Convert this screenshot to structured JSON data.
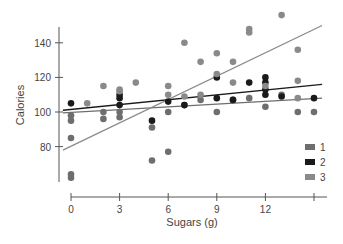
{
  "chart_data": {
    "type": "scatter",
    "title": "",
    "xlabel": "Sugars (g)",
    "ylabel": "Calories",
    "xlim": [
      0,
      15
    ],
    "ylim": [
      60,
      155
    ],
    "x_ticks": [
      0,
      3,
      6,
      9,
      12,
      15
    ],
    "x_tick_labels": [
      "0",
      "3",
      "6",
      "9",
      "12",
      ""
    ],
    "y_ticks": [
      80,
      100,
      120,
      140
    ],
    "y_tick_labels": [
      "80",
      "100",
      "120",
      "140"
    ],
    "grid": false,
    "legend_position": "lower-right",
    "legend": [
      {
        "label": "1",
        "color": "#6e6e6e"
      },
      {
        "label": "2",
        "color": "#1a1a1a"
      },
      {
        "label": "3",
        "color": "#8a8a8a"
      }
    ],
    "series": [
      {
        "name": "1",
        "color": "#6e6e6e",
        "points": [
          [
            0,
            62
          ],
          [
            0,
            64
          ],
          [
            0,
            85
          ],
          [
            0,
            95
          ],
          [
            0,
            98
          ],
          [
            2,
            100
          ],
          [
            2,
            96
          ],
          [
            3,
            97
          ],
          [
            3,
            100
          ],
          [
            5,
            91
          ],
          [
            5,
            72
          ],
          [
            6,
            77
          ],
          [
            6,
            100
          ],
          [
            7,
            104
          ],
          [
            8,
            107
          ],
          [
            9,
            100
          ],
          [
            10,
            107
          ],
          [
            11,
            108
          ],
          [
            12,
            103
          ],
          [
            13,
            110
          ],
          [
            14,
            100
          ],
          [
            15,
            100
          ]
        ],
        "fit": {
          "x0": -0.5,
          "y0": 99.5,
          "x1": 15.5,
          "y1": 108
        }
      },
      {
        "name": "2",
        "color": "#1a1a1a",
        "points": [
          [
            0,
            105
          ],
          [
            3,
            104
          ],
          [
            3,
            108
          ],
          [
            3,
            110
          ],
          [
            5,
            95
          ],
          [
            6,
            106
          ],
          [
            7,
            104
          ],
          [
            9,
            108
          ],
          [
            9,
            120
          ],
          [
            10,
            107
          ],
          [
            11,
            117
          ],
          [
            12,
            110
          ],
          [
            12,
            113
          ],
          [
            12,
            117
          ],
          [
            12,
            120
          ],
          [
            13,
            109
          ],
          [
            15,
            108
          ]
        ],
        "fit": {
          "x0": -0.5,
          "y0": 101,
          "x1": 15.5,
          "y1": 116
        }
      },
      {
        "name": "3",
        "color": "#8a8a8a",
        "points": [
          [
            1,
            105
          ],
          [
            2,
            115
          ],
          [
            3,
            112
          ],
          [
            3,
            113
          ],
          [
            4,
            117
          ],
          [
            6,
            115
          ],
          [
            6,
            110
          ],
          [
            7,
            140
          ],
          [
            7,
            109
          ],
          [
            8,
            129
          ],
          [
            8,
            110
          ],
          [
            9,
            134
          ],
          [
            9,
            122
          ],
          [
            10,
            129
          ],
          [
            10,
            117
          ],
          [
            11,
            148
          ],
          [
            11,
            146
          ],
          [
            12,
            115
          ],
          [
            13,
            156
          ],
          [
            14,
            136
          ],
          [
            14,
            118
          ],
          [
            14,
            108
          ]
        ],
        "fit": {
          "x0": -0.5,
          "y0": 78,
          "x1": 15.5,
          "y1": 150
        }
      }
    ]
  }
}
